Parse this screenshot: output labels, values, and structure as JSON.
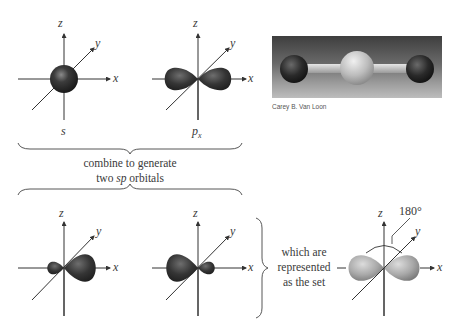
{
  "diagram": {
    "top_row": {
      "s_orbital": {
        "label": "s",
        "axes": {
          "z": "z",
          "y": "y",
          "x": "x"
        }
      },
      "px_orbital": {
        "label_main": "p",
        "label_sub": "x",
        "axes": {
          "z": "z",
          "y": "y",
          "x": "x"
        }
      },
      "photo": {
        "description": "ball-and-stick model of linear molecule",
        "credit": "Carey B. Van Loon"
      }
    },
    "middle": {
      "caption_line1": "combine to generate",
      "caption_line2_pre": "two ",
      "caption_line2_italic": "sp",
      "caption_line2_post": " orbitals"
    },
    "bottom_row": {
      "sp_orbital_1": {
        "axes": {
          "z": "z",
          "y": "y",
          "x": "x"
        }
      },
      "sp_orbital_2": {
        "axes": {
          "z": "z",
          "y": "y",
          "x": "x"
        }
      },
      "side_caption": [
        "which are",
        "represented",
        "as the set"
      ],
      "sp_set": {
        "axes": {
          "z": "z",
          "y": "y",
          "x": "x"
        },
        "angle_label": "180°"
      }
    },
    "colors": {
      "orbital_dark": "#2e2e2e",
      "orbital_light": "#bdbdbd",
      "axis": "#333333",
      "text": "#3a3a3a"
    }
  }
}
